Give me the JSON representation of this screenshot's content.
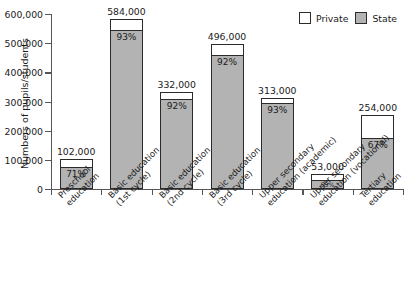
{
  "chart_data": {
    "type": "bar",
    "stacked": true,
    "title": "",
    "xlabel": "",
    "ylabel": "Numbers of pupils/students",
    "ylim": [
      0,
      600000
    ],
    "ytick_values": [
      0,
      100000,
      200000,
      300000,
      400000,
      500000,
      600000
    ],
    "ytick_labels": [
      "0",
      "100,000",
      "200,000",
      "300,000",
      "400,000",
      "500,000",
      "600,000"
    ],
    "grid": false,
    "legend_position": "top-right",
    "legend": [
      {
        "name": "Private",
        "color": "#ffffff"
      },
      {
        "name": "State",
        "color": "#b3b3b3"
      }
    ],
    "categories": [
      {
        "lines": [
          "Preschool",
          "education"
        ]
      },
      {
        "lines": [
          "Basic education",
          "(1st cycle)"
        ]
      },
      {
        "lines": [
          "Basic education",
          "(2nd cycle)"
        ]
      },
      {
        "lines": [
          "Basic education",
          "(3rd cycle)"
        ]
      },
      {
        "lines": [
          "Upper secondary",
          "education (academic)"
        ]
      },
      {
        "lines": [
          "Upper secondary",
          "education (vocational)"
        ]
      },
      {
        "lines": [
          "Tertiary",
          "education"
        ]
      }
    ],
    "totals": [
      102000,
      584000,
      332000,
      496000,
      313000,
      53000,
      254000
    ],
    "total_labels": [
      "102,000",
      "584,000",
      "332,000",
      "496,000",
      "313,000",
      "53,000",
      "254,000"
    ],
    "state_percent": [
      71,
      93,
      92,
      92,
      93,
      53,
      67
    ],
    "state_percent_labels": [
      "71%",
      "93%",
      "92%",
      "92%",
      "93%",
      "53%",
      "67%"
    ],
    "series": [
      {
        "name": "State",
        "values": [
          72420,
          543120,
          305440,
          456320,
          291090,
          28090,
          170180
        ]
      },
      {
        "name": "Private",
        "values": [
          29580,
          40880,
          26560,
          39680,
          21910,
          24910,
          83820
        ]
      }
    ]
  },
  "colors": {
    "state_fill": "#b3b3b3",
    "private_fill": "#ffffff",
    "outline": "#2b2b2b",
    "axis": "#555555",
    "text": "#1a1a1a"
  }
}
